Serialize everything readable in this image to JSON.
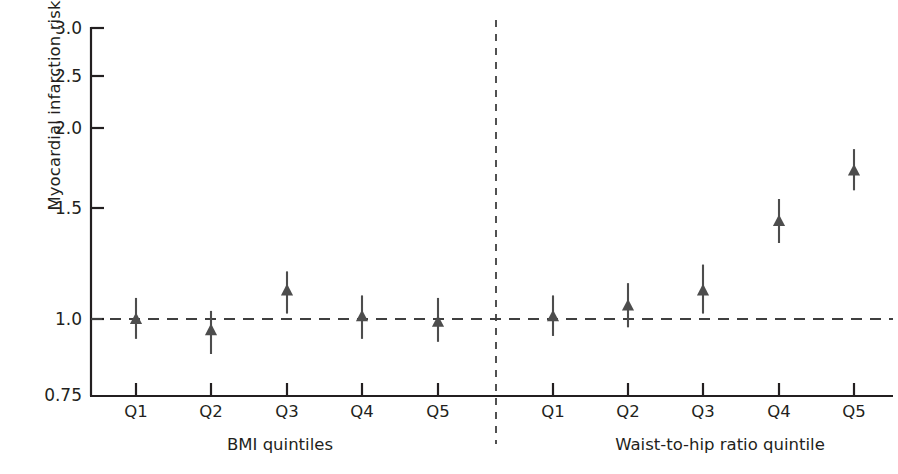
{
  "chart_data": {
    "type": "scatter",
    "title": "",
    "xlabel": "",
    "ylabel": "Myocardial infarction risk",
    "yscale": "log",
    "ylim": [
      0.75,
      3.0
    ],
    "yticks": [
      3.0,
      2.5,
      2.0,
      1.5,
      1.0,
      0.75
    ],
    "ytick_labels": [
      "3.0",
      "2.5",
      "2.0",
      "1.5",
      "1.0",
      "0.75"
    ],
    "grid": false,
    "legend": null,
    "reference_line": {
      "y": 1.0,
      "style": "dashed",
      "color": "#3f3f3f"
    },
    "panel_divider": {
      "style": "dashed",
      "color": "#3f3f3f"
    },
    "marker": {
      "shape": "triangle-up",
      "color": "#4d4d4d",
      "errorbar": "vertical"
    },
    "categories": [
      "Q1",
      "Q2",
      "Q3",
      "Q4",
      "Q5"
    ],
    "panels": [
      {
        "name": "bmi",
        "label": "BMI quintiles",
        "points": [
          {
            "x": "Q1",
            "y": 1.0,
            "lo": 0.93,
            "hi": 1.08
          },
          {
            "x": "Q2",
            "y": 0.96,
            "lo": 0.88,
            "hi": 1.03
          },
          {
            "x": "Q3",
            "y": 1.11,
            "lo": 1.02,
            "hi": 1.19
          },
          {
            "x": "Q4",
            "y": 1.01,
            "lo": 0.93,
            "hi": 1.09
          },
          {
            "x": "Q5",
            "y": 0.99,
            "lo": 0.92,
            "hi": 1.08
          }
        ]
      },
      {
        "name": "whr",
        "label": "Waist-to-hip ratio quintile",
        "points": [
          {
            "x": "Q1",
            "y": 1.01,
            "lo": 0.94,
            "hi": 1.09
          },
          {
            "x": "Q2",
            "y": 1.05,
            "lo": 0.97,
            "hi": 1.14
          },
          {
            "x": "Q3",
            "y": 1.11,
            "lo": 1.02,
            "hi": 1.22
          },
          {
            "x": "Q4",
            "y": 1.43,
            "lo": 1.32,
            "hi": 1.55
          },
          {
            "x": "Q5",
            "y": 1.72,
            "lo": 1.6,
            "hi": 1.86
          }
        ]
      }
    ]
  },
  "axis": {
    "y_title": "Myocardial infarction risk",
    "y_labels": [
      "3.0",
      "2.5",
      "2.0",
      "1.5",
      "1.0",
      "0.75"
    ],
    "x_labels_left": [
      "Q1",
      "Q2",
      "Q3",
      "Q4",
      "Q5"
    ],
    "x_labels_right": [
      "Q1",
      "Q2",
      "Q3",
      "Q4",
      "Q5"
    ],
    "panel_label_left": "BMI quintiles",
    "panel_label_right": "Waist-to-hip ratio quintile"
  },
  "colors": {
    "axis": "#231f20",
    "marker": "#4d4d4d",
    "dashed": "#3f3f3f",
    "background": "#ffffff"
  }
}
